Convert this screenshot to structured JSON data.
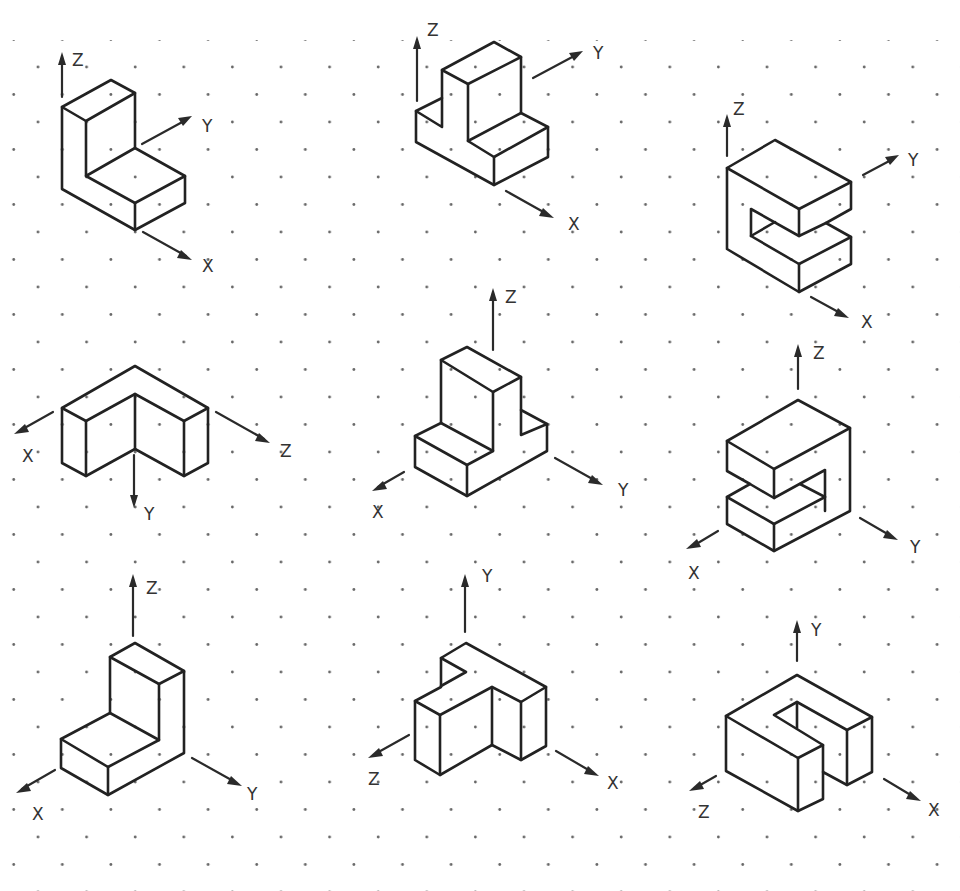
{
  "page": {
    "background": "#ffffff",
    "line_color": "#222222",
    "grid": "isometric dot grid"
  },
  "figures": [
    {
      "id": 1,
      "shape": "L-bracket",
      "axes": {
        "up": "Z",
        "right": "Y",
        "down_right": "X"
      }
    },
    {
      "id": 2,
      "shape": "T-block (upright)",
      "axes": {
        "up": "Z",
        "right": "Y",
        "down_right": "X"
      }
    },
    {
      "id": 3,
      "shape": "C-block",
      "axes": {
        "up": "Z",
        "right": "Y",
        "down_right": "X"
      }
    },
    {
      "id": 4,
      "shape": "Inverted V channel",
      "axes": {
        "left": "X",
        "right": "Z",
        "down": "Y"
      }
    },
    {
      "id": 5,
      "shape": "T-block (upright)",
      "axes": {
        "up": "Z",
        "left": "X",
        "right": "Y"
      }
    },
    {
      "id": 6,
      "shape": "C-block (rotated)",
      "axes": {
        "up": "Z",
        "left": "X",
        "right": "Y"
      }
    },
    {
      "id": 7,
      "shape": "L-bracket",
      "axes": {
        "up": "Z",
        "left": "X",
        "right": "Y"
      }
    },
    {
      "id": 8,
      "shape": "T-block (lying)",
      "axes": {
        "up": "Y",
        "left": "Z",
        "right": "X"
      }
    },
    {
      "id": 9,
      "shape": "U-block",
      "axes": {
        "up": "Y",
        "left": "Z",
        "right": "X"
      }
    }
  ],
  "labels": {
    "f1": {
      "z": "Z",
      "y": "Y",
      "x": "X"
    },
    "f2": {
      "z": "Z",
      "y": "Y",
      "x": "X"
    },
    "f3": {
      "z": "Z",
      "y": "Y",
      "x": "X"
    },
    "f4": {
      "x": "X",
      "z": "Z",
      "y": "Y"
    },
    "f5": {
      "z": "Z",
      "x": "X",
      "y": "Y"
    },
    "f6": {
      "z": "Z",
      "x": "X",
      "y": "Y"
    },
    "f7": {
      "z": "Z",
      "x": "X",
      "y": "Y"
    },
    "f8": {
      "y": "Y",
      "z": "Z",
      "x": "X"
    },
    "f9": {
      "y": "Y",
      "z": "Z",
      "x": "X"
    }
  }
}
